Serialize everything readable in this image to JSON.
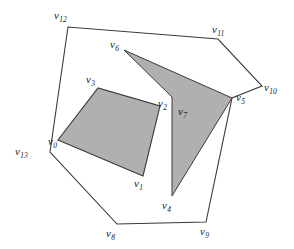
{
  "figure": {
    "caption": "",
    "background_color": "#ffffff",
    "fill_color": "#b0b0b0",
    "stroke_color": "#3a3a3a",
    "width": 294,
    "height": 249
  },
  "shapes": {
    "outer_polygon": {
      "name": "outer-polygon",
      "filled": false,
      "points": "50,152 68,27 218,39 262,86 232,98 206,222 117,224"
    },
    "inner_quad": {
      "name": "inner-quadrilateral",
      "filled": true,
      "points": "58,140 143,176 160,106 98,88"
    },
    "arrow_polygon": {
      "name": "arrow-polygon",
      "filled": true,
      "points": "124,50 232,98 172,196 172,97"
    }
  },
  "labels": [
    {
      "id": "v0",
      "base": "v",
      "sub": "0",
      "x": 48,
      "y": 136
    },
    {
      "id": "v1",
      "base": "v",
      "sub": "1",
      "x": 134,
      "y": 178
    },
    {
      "id": "v2",
      "base": "v",
      "sub": "2",
      "x": 158,
      "y": 98
    },
    {
      "id": "v3",
      "base": "v",
      "sub": "3",
      "x": 86,
      "y": 74
    },
    {
      "id": "v4",
      "base": "v",
      "sub": "4",
      "x": 162,
      "y": 200
    },
    {
      "id": "v5",
      "base": "v",
      "sub": "5",
      "x": 236,
      "y": 92
    },
    {
      "id": "v6",
      "base": "v",
      "sub": "6",
      "x": 110,
      "y": 39
    },
    {
      "id": "v7",
      "base": "v",
      "sub": "7",
      "x": 178,
      "y": 106
    },
    {
      "id": "v8",
      "base": "v",
      "sub": "8",
      "x": 106,
      "y": 228
    },
    {
      "id": "v9",
      "base": "v",
      "sub": "9",
      "x": 200,
      "y": 226
    },
    {
      "id": "v10",
      "base": "v",
      "sub": "10",
      "x": 264,
      "y": 82
    },
    {
      "id": "v11",
      "base": "v",
      "sub": "11",
      "x": 212,
      "y": 24
    },
    {
      "id": "v12",
      "base": "v",
      "sub": "12",
      "x": 54,
      "y": 10
    },
    {
      "id": "v13",
      "base": "v",
      "sub": "13",
      "x": 15,
      "y": 146
    }
  ]
}
